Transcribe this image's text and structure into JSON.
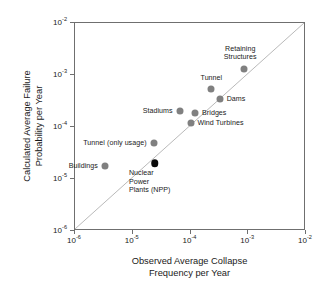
{
  "chart_data": {
    "type": "scatter",
    "title": "",
    "xlabel": "Observed Average Collapse Frequency per Year",
    "ylabel": "Calculated Average Failure Probability per Year",
    "xlabel_lines": [
      "Observed Average Collapse",
      "Frequency per Year"
    ],
    "ylabel_lines": [
      "Calculated Average Failure",
      "Probability per Year"
    ],
    "xscale": "log",
    "yscale": "log",
    "xlim": [
      1e-06,
      0.01
    ],
    "ylim": [
      1e-06,
      0.01
    ],
    "grid": false,
    "legend": "none",
    "xticks": [
      {
        "value": 1e-06,
        "mantissa": "10",
        "exponent": "-6"
      },
      {
        "value": 1e-05,
        "mantissa": "10",
        "exponent": "-5"
      },
      {
        "value": 0.0001,
        "mantissa": "10",
        "exponent": "-4"
      },
      {
        "value": 0.001,
        "mantissa": "10",
        "exponent": "-3"
      },
      {
        "value": 0.01,
        "mantissa": "10",
        "exponent": "-2"
      }
    ],
    "yticks": [
      {
        "value": 1e-06,
        "mantissa": "10",
        "exponent": "-6"
      },
      {
        "value": 1e-05,
        "mantissa": "10",
        "exponent": "-5"
      },
      {
        "value": 0.0001,
        "mantissa": "10",
        "exponent": "-4"
      },
      {
        "value": 0.001,
        "mantissa": "10",
        "exponent": "-3"
      },
      {
        "value": 0.01,
        "mantissa": "10",
        "exponent": "-2"
      }
    ],
    "annotations": [
      {
        "name": "reference-line",
        "type": "line",
        "description": "one-to-one diagonal reference line",
        "from": [
          1e-06,
          1e-06
        ],
        "to": [
          0.01,
          0.01
        ],
        "color": "#b0b0b0",
        "style": "solid"
      }
    ],
    "marker_color": "#808080",
    "highlight_color": "#0a0a0a",
    "points": [
      {
        "label": "Buildings",
        "label_lines": [
          "Buildings"
        ],
        "x": 3.3e-06,
        "y": 1.8e-05,
        "color": "#808080",
        "highlight": false,
        "label_position": "left"
      },
      {
        "label": "Tunnel (only usage)",
        "label_lines": [
          "Tunnel (only usage)"
        ],
        "x": 2.3e-05,
        "y": 5e-05,
        "color": "#808080",
        "highlight": false,
        "label_position": "left"
      },
      {
        "label": "Nuclear Power Plants (NPP)",
        "label_lines": [
          "Nuclear",
          "Power",
          "Plants (NPP)"
        ],
        "x": 2.4e-05,
        "y": 2e-05,
        "color": "#0a0a0a",
        "highlight": true,
        "label_position": "below"
      },
      {
        "label": "Stadiums",
        "label_lines": [
          "Stadiums"
        ],
        "x": 6.5e-05,
        "y": 0.0002,
        "color": "#808080",
        "highlight": false,
        "label_position": "left"
      },
      {
        "label": "Wind Turbines",
        "label_lines": [
          "Wind Turbines"
        ],
        "x": 0.0001,
        "y": 0.00012,
        "color": "#808080",
        "highlight": false,
        "label_position": "right"
      },
      {
        "label": "Bridges",
        "label_lines": [
          "Bridges"
        ],
        "x": 0.00012,
        "y": 0.00019,
        "color": "#808080",
        "highlight": false,
        "label_position": "right"
      },
      {
        "label": "Tunnel",
        "label_lines": [
          "Tunnel"
        ],
        "x": 0.00023,
        "y": 0.00055,
        "color": "#808080",
        "highlight": false,
        "label_position": "above"
      },
      {
        "label": "Dams",
        "label_lines": [
          "Dams"
        ],
        "x": 0.00032,
        "y": 0.00035,
        "color": "#808080",
        "highlight": false,
        "label_position": "right"
      },
      {
        "label": "Retaining Structures",
        "label_lines": [
          "Retaining",
          "Structures"
        ],
        "x": 0.00085,
        "y": 0.0013,
        "color": "#808080",
        "highlight": false,
        "label_position": "above-left"
      }
    ]
  }
}
